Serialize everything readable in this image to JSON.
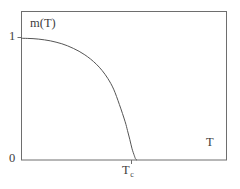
{
  "chart_data": {
    "type": "line",
    "title": "",
    "subtitle": "",
    "xlabel": "T",
    "ylabel": "m(T)",
    "x_tick_labels": [
      "T_c"
    ],
    "y_tick_labels": [
      "0",
      "1"
    ],
    "xlim": [
      0,
      1.78
    ],
    "ylim": [
      0,
      1.22
    ],
    "grid": false,
    "legend": false,
    "legend_position": "none",
    "annotations": [
      {
        "name": "order-parameter-label",
        "text": "m(T)",
        "x": 0.13,
        "y": 1.12
      },
      {
        "name": "temperature-axis-label",
        "text": "T",
        "x": 1.68,
        "y": 0.13
      }
    ],
    "series": [
      {
        "name": "magnetization",
        "description": "Mean-field order parameter m(T) vanishing continuously at the critical temperature T_c with exponent 1/2",
        "color": "#555555",
        "linewidth": 1,
        "x": [
          0.0,
          0.05,
          0.1,
          0.15,
          0.2,
          0.25,
          0.3,
          0.35,
          0.4,
          0.45,
          0.5,
          0.55,
          0.6,
          0.65,
          0.7,
          0.75,
          0.8,
          0.85,
          0.9,
          0.92,
          0.94,
          0.96,
          0.98,
          0.99,
          1.0
        ],
        "y": [
          1.0,
          0.999,
          0.997,
          0.993,
          0.987,
          0.979,
          0.968,
          0.955,
          0.938,
          0.917,
          0.893,
          0.864,
          0.829,
          0.787,
          0.735,
          0.669,
          0.582,
          0.456,
          0.314,
          0.243,
          0.17,
          0.092,
          0.035,
          0.01,
          0.0
        ]
      }
    ],
    "critical_point": {
      "name": "T_c",
      "x": 1.0,
      "y": 0.0
    }
  },
  "axes": {
    "y_tick_1": "1",
    "y_tick_0": "0",
    "x_tick_tc_base": "T",
    "x_tick_tc_sub": "c",
    "y_axis_title": "m(T)",
    "x_axis_title": "T"
  },
  "style": {
    "background_color": "#ffffff",
    "frame_color": "#6e6e6e",
    "curve_color": "#555555",
    "text_color": "#3d3d3d"
  }
}
